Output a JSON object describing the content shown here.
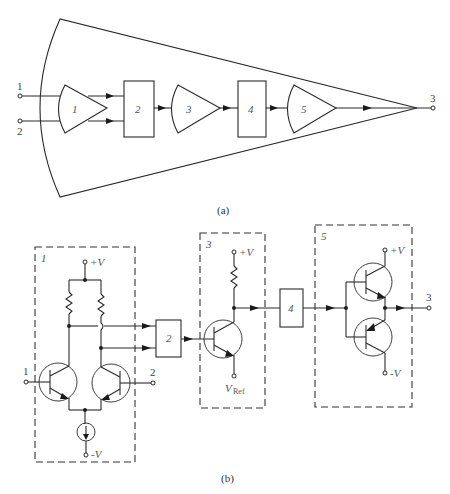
{
  "figure": {
    "part_a": {
      "caption": "(a)",
      "inputs": [
        {
          "label": "1"
        },
        {
          "label": "2"
        }
      ],
      "output": {
        "label": "3"
      },
      "blocks": [
        {
          "id": "1",
          "shape": "amplifier",
          "label": "1"
        },
        {
          "id": "2",
          "shape": "box",
          "label": "2"
        },
        {
          "id": "3",
          "shape": "amplifier",
          "label": "3"
        },
        {
          "id": "4",
          "shape": "box",
          "label": "4"
        },
        {
          "id": "5",
          "shape": "amplifier",
          "label": "5"
        }
      ]
    },
    "part_b": {
      "caption": "(b)",
      "stage1": {
        "label": "1",
        "vplus": "+V",
        "vminus": "-V",
        "input1": "1",
        "input2": "2"
      },
      "block2": {
        "label": "2"
      },
      "stage3": {
        "label": "3",
        "vplus": "+V",
        "vref_main": "V",
        "vref_sub": "Ref"
      },
      "block4": {
        "label": "4"
      },
      "stage5": {
        "label": "5",
        "vplus": "+V",
        "vminus": "-V",
        "output": "3"
      }
    }
  }
}
